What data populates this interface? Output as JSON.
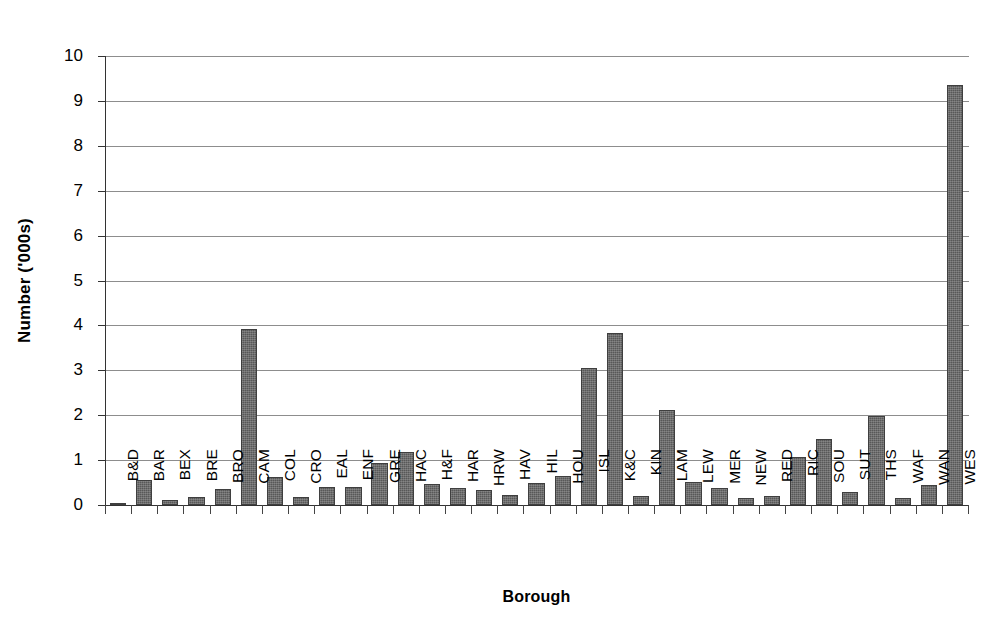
{
  "chart_data": {
    "type": "bar",
    "title": "",
    "xlabel": "Borough",
    "ylabel": "Number ('000s)",
    "ylim": [
      0,
      10
    ],
    "yticks": [
      "0",
      "1",
      "2",
      "3",
      "4",
      "5",
      "6",
      "7",
      "8",
      "9",
      "10"
    ],
    "grid": true,
    "legend": null,
    "bar_color": "#585858",
    "axis_color": "#333333",
    "gridline_color": "#8d8d8d",
    "categories": [
      "B&D",
      "BAR",
      "BEX",
      "BRE",
      "BRO",
      "CAM",
      "COL",
      "CRO",
      "EAL",
      "ENF",
      "GRE",
      "HAC",
      "H&F",
      "HAR",
      "HRW",
      "HAV",
      "HIL",
      "HOU",
      "ISL",
      "K&C",
      "KIN",
      "LAM",
      "LEW",
      "MER",
      "NEW",
      "RED",
      "RIC",
      "SOU",
      "SUT",
      "THS",
      "WAF",
      "WAN",
      "WES"
    ],
    "values": [
      0.03,
      0.56,
      0.11,
      0.18,
      0.36,
      3.93,
      0.62,
      0.17,
      0.41,
      0.41,
      0.93,
      1.18,
      0.47,
      0.39,
      0.34,
      0.22,
      0.5,
      0.64,
      3.05,
      3.82,
      0.21,
      2.11,
      0.52,
      0.37,
      0.16,
      0.19,
      1.08,
      1.48,
      0.29,
      1.98,
      0.15,
      0.45,
      9.36
    ]
  }
}
